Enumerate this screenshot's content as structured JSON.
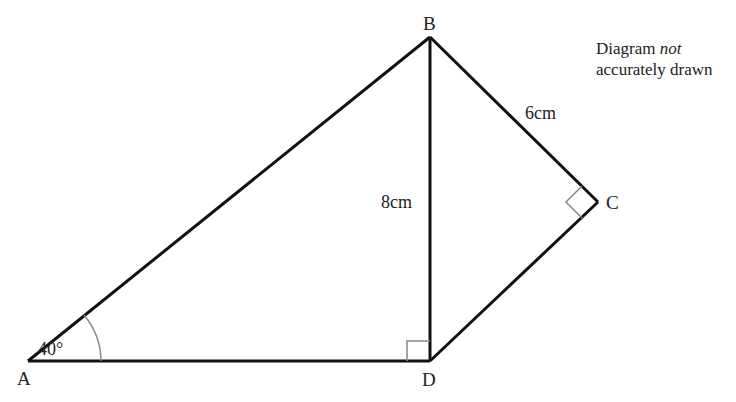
{
  "diagram": {
    "type": "geometry",
    "vertices": {
      "A": {
        "label": "A",
        "x": 28,
        "y": 361
      },
      "B": {
        "label": "B",
        "x": 430,
        "y": 37
      },
      "C": {
        "label": "C",
        "x": 598,
        "y": 202
      },
      "D": {
        "label": "D",
        "x": 430,
        "y": 361
      }
    },
    "segments": [
      {
        "from": "A",
        "to": "B"
      },
      {
        "from": "A",
        "to": "D"
      },
      {
        "from": "B",
        "to": "D",
        "label": "8cm"
      },
      {
        "from": "B",
        "to": "C",
        "label": "6cm"
      },
      {
        "from": "C",
        "to": "D"
      }
    ],
    "angle_label": "40°",
    "right_angles": [
      "BDA",
      "BCD"
    ],
    "lengths": {
      "BD": "8cm",
      "BC": "6cm"
    },
    "note": {
      "line1_prefix": "Diagram ",
      "line1_italic": "not",
      "line2": "accurately drawn"
    },
    "colors": {
      "line": "#111111",
      "marker": "#888888",
      "text": "#222222"
    }
  }
}
